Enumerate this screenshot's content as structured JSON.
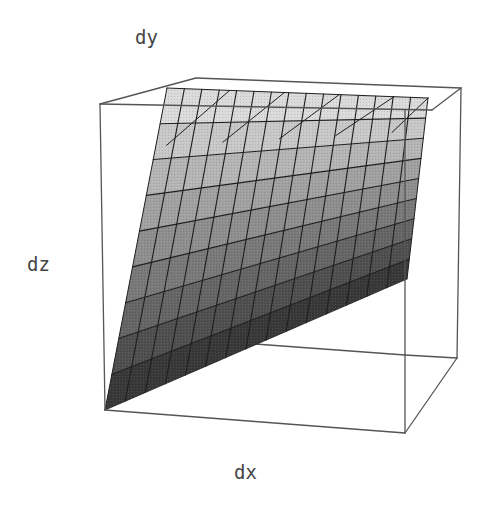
{
  "chart_data": {
    "type": "surface3d",
    "title": "",
    "axis_labels": {
      "x": "dx",
      "y": "dy",
      "z": "dz"
    },
    "grid": false,
    "box": true,
    "legend": null,
    "mesh": {
      "u_lines": 15,
      "v_bands": 9
    },
    "shading": {
      "dark": "#2a2a2a",
      "light": "#e4e4e4"
    }
  },
  "colors": {
    "background": "#ffffff",
    "box_edge": "#555555",
    "mesh_line": "#1e1e1e",
    "label": "#444444"
  },
  "geometry": {
    "box": {
      "top_front_left": [
        100,
        104
      ],
      "top_front_right": [
        432,
        110
      ],
      "top_back_left": [
        196,
        78
      ],
      "top_back_right": [
        461,
        88
      ],
      "bottom_front_left": [
        105,
        410
      ],
      "bottom_front_right": [
        405,
        433
      ],
      "bottom_back_right": [
        457,
        358
      ],
      "back_bottom_mid": [
        255,
        344
      ],
      "back_bottom_right_inner": [
        405,
        355
      ]
    },
    "surface": {
      "apex": [
        105,
        410
      ],
      "top_left": [
        167,
        88
      ],
      "top_right": [
        428,
        98
      ],
      "right_bottom": [
        407,
        279
      ]
    }
  }
}
